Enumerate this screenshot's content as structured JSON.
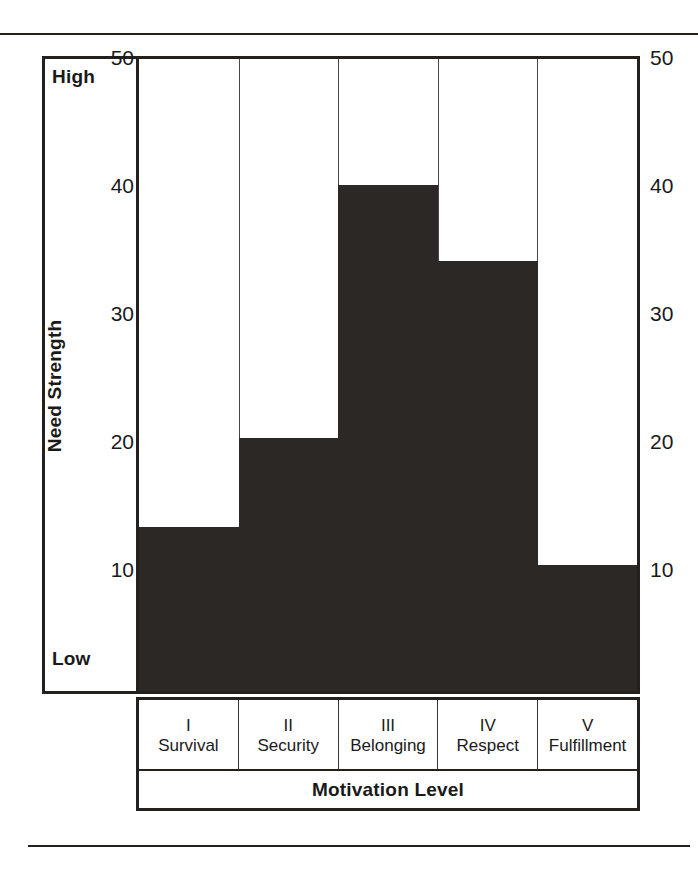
{
  "chart_data": {
    "type": "bar",
    "title": "",
    "xlabel": "Motivation Level",
    "ylabel": "Need Strength",
    "categories": [
      "Survival",
      "Security",
      "Belonging",
      "Respect",
      "Fulfillment"
    ],
    "category_romans": [
      "I",
      "II",
      "III",
      "IV",
      "V"
    ],
    "values": [
      13,
      20,
      40,
      34,
      10
    ],
    "ylim": [
      0,
      50
    ],
    "yticks": [
      10,
      20,
      30,
      40,
      50
    ],
    "ytick_labels": [
      "10",
      "20",
      "30",
      "40",
      "50"
    ],
    "y_axis_endpoint_labels": {
      "high": "High",
      "low": "Low"
    },
    "grid": false,
    "legend": false,
    "axis_duplicated_right": true,
    "bar_color": "#2b2826",
    "frame_color": "#23201e",
    "background": "#ffffff"
  },
  "axis": {
    "left_labels": [
      "50",
      "40",
      "30",
      "20",
      "10"
    ],
    "right_labels": [
      "50",
      "40",
      "30",
      "20",
      "10"
    ]
  }
}
